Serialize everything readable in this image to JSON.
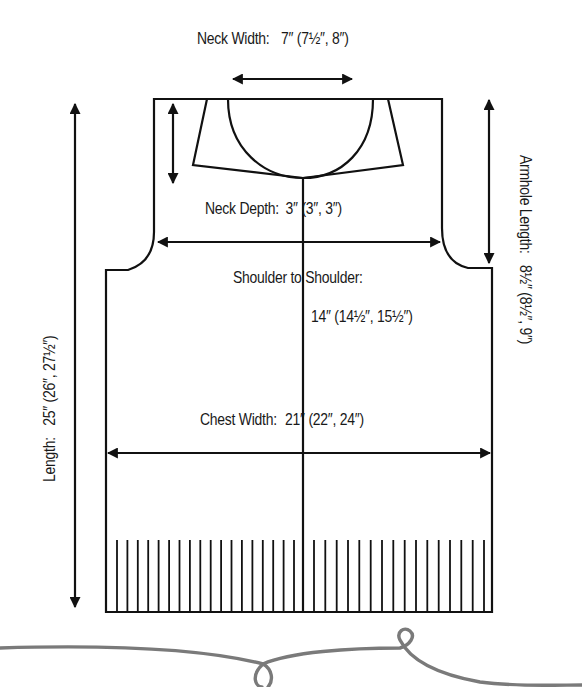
{
  "diagram": {
    "type": "knitting-schematic",
    "garment": "vest",
    "colors": {
      "line": "#111111",
      "yarn_flourish": "#7a7a7a",
      "background": "#ffffff"
    },
    "measurements": {
      "neck_width": {
        "label": "Neck Width:",
        "value": "7″ (7½″, 8″)"
      },
      "neck_depth": {
        "label": "Neck Depth:",
        "value": "3″ (3″, 3″)"
      },
      "shoulder_to_shoulder": {
        "label": "Shoulder to Shoulder:",
        "value": "14″ (14½″, 15½″)"
      },
      "chest_width": {
        "label": "Chest Width:",
        "value": "21″ (22″, 24″)"
      },
      "length": {
        "label": "Length:",
        "value": "25″ (26″, 27½″)"
      },
      "armhole_length": {
        "label": "Armhole Length:",
        "value": "8½″ (8½″, 9″)"
      }
    },
    "ribbing": {
      "left_count": 18,
      "right_count": 16
    }
  }
}
